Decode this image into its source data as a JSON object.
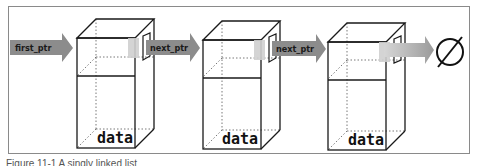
{
  "diagram": {
    "type": "singly-linked-list",
    "head_pointer": {
      "label": "first_ptr",
      "icon": "arrow-right-icon"
    },
    "nodes": [
      {
        "data_label": "data",
        "pointer_label": "next_ptr"
      },
      {
        "data_label": "data",
        "pointer_label": "next_ptr"
      },
      {
        "data_label": "data",
        "pointer_label": ""
      }
    ],
    "terminator": {
      "symbol": "∅",
      "meaning": "null"
    },
    "colors": {
      "arrow": "#8c8c8c",
      "arrow_light": "#bdbdbd",
      "edge": "#1a1a1a",
      "frame": "#8a8a8a"
    }
  },
  "caption": "Figure 11-1  A singly linked list"
}
